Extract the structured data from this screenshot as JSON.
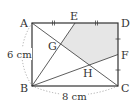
{
  "diagram": {
    "type": "geometry-rectangle",
    "colors": {
      "stroke": "#333333",
      "shade": "#e6e6e6",
      "arc": "#9a9a9a",
      "text": "#333333"
    },
    "points": {
      "A": {
        "label": "A",
        "x": 32,
        "y": 23
      },
      "B": {
        "label": "B",
        "x": 32,
        "y": 86
      },
      "C": {
        "label": "C",
        "x": 118,
        "y": 86
      },
      "D": {
        "label": "D",
        "x": 118,
        "y": 23
      },
      "E": {
        "label": "E",
        "x": 75,
        "y": 23
      },
      "F": {
        "label": "F",
        "x": 118,
        "y": 54.5
      },
      "G": {
        "label": "G",
        "x": 60.7,
        "y": 44
      },
      "H": {
        "label": "H",
        "x": 89.3,
        "y": 65
      }
    },
    "dimensions": {
      "AB": "6 cm",
      "BC": "8 cm"
    },
    "shaded_region": [
      "E",
      "D",
      "F",
      "H",
      "G"
    ],
    "segments": [
      "AB",
      "BC",
      "CD",
      "DA",
      "AC",
      "BE",
      "BF"
    ],
    "equal_marks": {
      "AE_ED": "double tick",
      "DF_FC": "single tick"
    }
  }
}
